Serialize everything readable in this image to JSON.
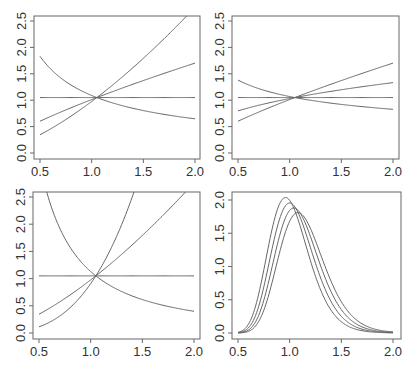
{
  "figure": {
    "line_color": "#666666",
    "frame_color": "#666666",
    "text_color": "#333333"
  },
  "chart_data": [
    {
      "type": "line",
      "panel": "top-left",
      "title": "",
      "xlabel": "",
      "ylabel": "",
      "xlim": [
        0.5,
        2.0
      ],
      "ylim": [
        0.0,
        2.5
      ],
      "xticks": [
        "0.5",
        "1.0",
        "1.5",
        "2.0"
      ],
      "yticks": [
        "0.0",
        "0.5",
        "1.0",
        "1.5",
        "2.0",
        "2.5"
      ],
      "grid": false,
      "legend": null,
      "series": [
        {
          "name": "k=0",
          "x": [
            0.5,
            1.0,
            1.5,
            2.0
          ],
          "y": [
            1.05,
            1.05,
            1.05,
            1.05
          ],
          "power": 0
        },
        {
          "name": "k=0.75",
          "x": [
            0.5,
            1.0,
            1.5,
            2.0
          ],
          "y": [
            0.6,
            1.01,
            1.37,
            1.72
          ],
          "power": 0.75
        },
        {
          "name": "k=1.5",
          "x": [
            0.5,
            1.0,
            1.5,
            1.9
          ],
          "y": [
            0.35,
            0.98,
            1.79,
            2.5
          ],
          "power": 1.5
        },
        {
          "name": "k=-0.75",
          "x": [
            0.5,
            1.0,
            1.5,
            2.0
          ],
          "y": [
            1.8,
            1.09,
            0.8,
            0.62
          ],
          "power": -0.75
        }
      ]
    },
    {
      "type": "line",
      "panel": "top-right",
      "title": "",
      "xlabel": "",
      "ylabel": "",
      "xlim": [
        0.5,
        2.0
      ],
      "ylim": [
        0.0,
        2.5
      ],
      "xticks": [
        "0.5",
        "1.0",
        "1.5",
        "2.0"
      ],
      "yticks": [
        "0.0",
        "0.5",
        "1.0",
        "1.5",
        "2.0",
        "2.5"
      ],
      "grid": false,
      "legend": null,
      "series": [
        {
          "name": "k=0",
          "x": [
            0.5,
            1.0,
            1.5,
            2.0
          ],
          "y": [
            1.05,
            1.05,
            1.05,
            1.05
          ],
          "power": 0
        },
        {
          "name": "k=0.37",
          "x": [
            0.5,
            1.0,
            1.5,
            2.0
          ],
          "y": [
            0.8,
            1.03,
            1.2,
            1.36
          ],
          "power": 0.37
        },
        {
          "name": "k=0.75",
          "x": [
            0.5,
            1.0,
            1.5,
            2.0
          ],
          "y": [
            0.6,
            1.01,
            1.37,
            1.72
          ],
          "power": 0.75
        },
        {
          "name": "k=-0.37",
          "x": [
            0.5,
            1.0,
            1.5,
            2.0
          ],
          "y": [
            1.37,
            1.07,
            0.92,
            0.83
          ],
          "power": -0.37
        }
      ]
    },
    {
      "type": "line",
      "panel": "bottom-left",
      "title": "",
      "xlabel": "",
      "ylabel": "",
      "xlim": [
        0.5,
        2.0
      ],
      "ylim": [
        0.0,
        2.5
      ],
      "xticks": [
        "0.5",
        "1.0",
        "1.5",
        "2.0"
      ],
      "yticks": [
        "0.0",
        "0.5",
        "1.0",
        "1.5",
        "2.0",
        "2.5"
      ],
      "grid": false,
      "legend": null,
      "series": [
        {
          "name": "k=0",
          "x": [
            0.5,
            1.0,
            1.5,
            2.0
          ],
          "y": [
            1.05,
            1.05,
            1.05,
            1.05
          ],
          "power": 0
        },
        {
          "name": "k=1.5",
          "x": [
            0.5,
            1.0,
            1.5,
            1.92
          ],
          "y": [
            0.35,
            0.98,
            1.79,
            2.5
          ],
          "power": 1.5
        },
        {
          "name": "k=3",
          "x": [
            0.5,
            1.0,
            1.25,
            1.47
          ],
          "y": [
            0.1,
            0.91,
            1.77,
            2.5
          ],
          "power": 3
        },
        {
          "name": "k=-1.5",
          "x": [
            0.6,
            1.0,
            1.5,
            2.0
          ],
          "y": [
            2.5,
            1.13,
            0.61,
            0.37
          ],
          "power": -1.5
        }
      ]
    },
    {
      "type": "line",
      "panel": "bottom-right",
      "title": "",
      "xlabel": "",
      "ylabel": "",
      "xlim": [
        0.5,
        2.0
      ],
      "ylim": [
        0.0,
        2.0
      ],
      "xticks": [
        "0.5",
        "1.0",
        "1.5",
        "2.0"
      ],
      "yticks": [
        "0.0",
        "0.5",
        "1.0",
        "1.5",
        "2.0"
      ],
      "grid": false,
      "legend": null,
      "series": [
        {
          "name": "density mode 0.96",
          "mode": 0.96,
          "peak": 2.02,
          "sigma": 0.2
        },
        {
          "name": "density mode 1.00",
          "mode": 1.0,
          "peak": 1.96,
          "sigma": 0.2
        },
        {
          "name": "density mode 1.04",
          "mode": 1.04,
          "peak": 1.91,
          "sigma": 0.2
        },
        {
          "name": "density mode 1.08",
          "mode": 1.08,
          "peak": 1.86,
          "sigma": 0.2
        }
      ]
    }
  ],
  "panels_layout": [
    {
      "frame": [
        34,
        16,
        200,
        159
      ],
      "x0px": 40,
      "x1px": 195,
      "y0px": 153,
      "y1px": 21
    },
    {
      "frame": [
        232,
        16,
        399,
        159
      ],
      "x0px": 238,
      "x1px": 393,
      "y0px": 153,
      "y1px": 21
    },
    {
      "frame": [
        33,
        192,
        200,
        339
      ],
      "x0px": 39,
      "x1px": 194,
      "y0px": 333,
      "y1px": 197
    },
    {
      "frame": [
        232,
        192,
        401,
        339
      ],
      "x0px": 238,
      "x1px": 393,
      "y0px": 333,
      "y1px": 200
    }
  ]
}
